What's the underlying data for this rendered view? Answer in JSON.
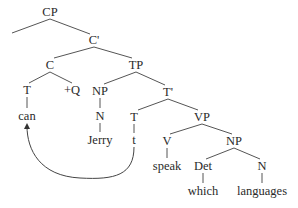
{
  "diagram": {
    "type": "syntax-tree",
    "nodes": [
      {
        "id": "CP",
        "label": "CP",
        "x": 50,
        "y": 12
      },
      {
        "id": "Cbar",
        "label": "C'",
        "x": 94,
        "y": 40
      },
      {
        "id": "C",
        "label": "C",
        "x": 50,
        "y": 65
      },
      {
        "id": "TP",
        "label": "TP",
        "x": 136,
        "y": 65
      },
      {
        "id": "T1",
        "label": "T",
        "x": 27,
        "y": 90
      },
      {
        "id": "Q",
        "label": "+Q",
        "x": 72,
        "y": 90
      },
      {
        "id": "NP1",
        "label": "NP",
        "x": 100,
        "y": 91
      },
      {
        "id": "Tbar",
        "label": "T'",
        "x": 168,
        "y": 92
      },
      {
        "id": "can",
        "label": "can",
        "x": 27,
        "y": 116
      },
      {
        "id": "N1",
        "label": "N",
        "x": 100,
        "y": 116
      },
      {
        "id": "T2",
        "label": "T",
        "x": 134,
        "y": 117
      },
      {
        "id": "VP",
        "label": "VP",
        "x": 202,
        "y": 117
      },
      {
        "id": "Jerry",
        "label": "Jerry",
        "x": 100,
        "y": 140
      },
      {
        "id": "trace",
        "label": "t",
        "x": 134,
        "y": 140
      },
      {
        "id": "V",
        "label": "V",
        "x": 167,
        "y": 141
      },
      {
        "id": "NP2",
        "label": "NP",
        "x": 234,
        "y": 141
      },
      {
        "id": "speak",
        "label": "speak",
        "x": 167,
        "y": 166
      },
      {
        "id": "Det",
        "label": "Det",
        "x": 203,
        "y": 166
      },
      {
        "id": "N2",
        "label": "N",
        "x": 262,
        "y": 166
      },
      {
        "id": "which",
        "label": "which",
        "x": 203,
        "y": 191
      },
      {
        "id": "languages",
        "label": "languages",
        "x": 262,
        "y": 191
      }
    ],
    "edges": [
      [
        "CP",
        "spec-empty"
      ],
      [
        "CP",
        "Cbar"
      ],
      [
        "Cbar",
        "C"
      ],
      [
        "Cbar",
        "TP"
      ],
      [
        "C",
        "T1"
      ],
      [
        "C",
        "Q"
      ],
      [
        "TP",
        "NP1"
      ],
      [
        "TP",
        "Tbar"
      ],
      [
        "T1",
        "can"
      ],
      [
        "NP1",
        "N1"
      ],
      [
        "N1",
        "Jerry"
      ],
      [
        "Tbar",
        "T2"
      ],
      [
        "Tbar",
        "VP"
      ],
      [
        "T2",
        "trace"
      ],
      [
        "VP",
        "V"
      ],
      [
        "VP",
        "NP2"
      ],
      [
        "V",
        "speak"
      ],
      [
        "NP2",
        "Det"
      ],
      [
        "NP2",
        "N2"
      ],
      [
        "Det",
        "which"
      ],
      [
        "N2",
        "languages"
      ]
    ],
    "movement_arrow": {
      "from": "trace",
      "to": "can",
      "description": "T-to-C movement"
    }
  }
}
